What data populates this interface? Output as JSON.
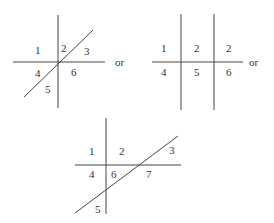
{
  "figures": [
    {
      "id": "fig-a",
      "regions": [
        "1",
        "2",
        "3",
        "4",
        "5",
        "6"
      ],
      "connector": "or"
    },
    {
      "id": "fig-b",
      "regions": [
        "1",
        "2",
        "2",
        "4",
        "5",
        "6"
      ],
      "connector": "or"
    },
    {
      "id": "fig-c",
      "regions": [
        "1",
        "2",
        "3",
        "4",
        "6",
        "7",
        "5"
      ]
    }
  ]
}
